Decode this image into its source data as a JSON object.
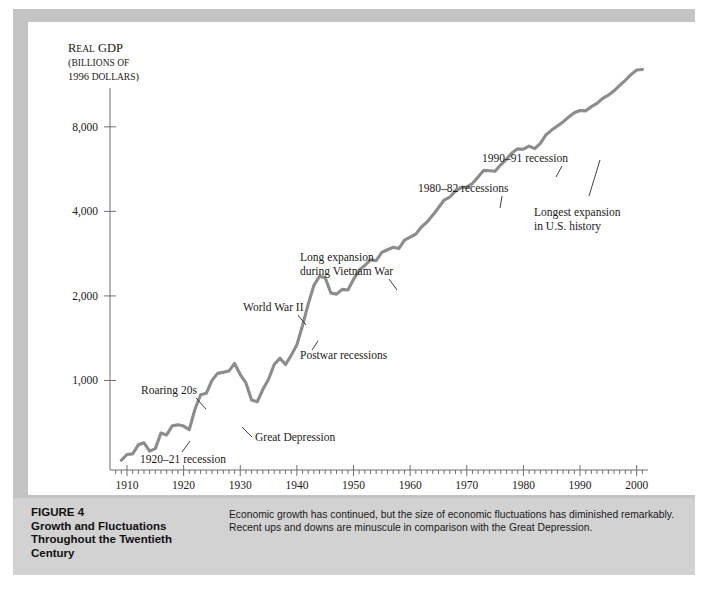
{
  "figure": {
    "caption_label": "FIGURE 4",
    "caption_title_lines": [
      "Growth and Fluctuations",
      "Throughout the Twentieth",
      "Century"
    ],
    "caption_body_lines": [
      "Economic growth has continued, but the size of economic fluctuations has diminished remarkably.",
      "Recent ups and downs are minuscule in comparison with the Great Depression."
    ],
    "frame_color": "#c4c4c4",
    "caption_band_color": "#d2d2d2"
  },
  "chart_data": {
    "type": "line",
    "title": "",
    "xlabel": "",
    "ylabel": "Real GDP (billions of 1996 dollars)",
    "ylabel_lines": [
      "Real GDP",
      "(billions of",
      "1996 dollars)"
    ],
    "yscale": "log",
    "ylim": [
      480,
      11000
    ],
    "xlim": [
      1907,
      2002
    ],
    "grid": false,
    "legend": "none",
    "line_color": "#8c8c8c",
    "yticks": [
      1000,
      2000,
      4000,
      8000
    ],
    "ytick_labels": [
      "1,000",
      "2,000",
      "4,000",
      "8,000"
    ],
    "xticks": [
      1910,
      1920,
      1930,
      1940,
      1950,
      1960,
      1970,
      1980,
      1990,
      2000
    ],
    "xtick_labels": [
      "1910",
      "1920",
      "1930",
      "1940",
      "1950",
      "1960",
      "1970",
      "1980",
      "1990",
      "2000"
    ],
    "x_minor_tick_step": 1,
    "series": [
      {
        "name": "Real GDP",
        "x": [
          1909,
          1910,
          1911,
          1912,
          1913,
          1914,
          1915,
          1916,
          1917,
          1918,
          1919,
          1920,
          1921,
          1922,
          1923,
          1924,
          1925,
          1926,
          1927,
          1928,
          1929,
          1930,
          1931,
          1932,
          1933,
          1934,
          1935,
          1936,
          1937,
          1938,
          1939,
          1940,
          1941,
          1942,
          1943,
          1944,
          1945,
          1946,
          1947,
          1948,
          1949,
          1950,
          1951,
          1952,
          1953,
          1954,
          1955,
          1956,
          1957,
          1958,
          1959,
          1960,
          1961,
          1962,
          1963,
          1964,
          1965,
          1966,
          1967,
          1968,
          1969,
          1970,
          1971,
          1972,
          1973,
          1974,
          1975,
          1976,
          1977,
          1978,
          1979,
          1980,
          1981,
          1982,
          1983,
          1984,
          1985,
          1986,
          1987,
          1988,
          1989,
          1990,
          1991,
          1992,
          1993,
          1994,
          1995,
          1996,
          1997,
          1998,
          1999,
          2000,
          2001
        ],
        "values": [
          520,
          545,
          548,
          590,
          600,
          560,
          572,
          650,
          640,
          690,
          695,
          688,
          668,
          790,
          890,
          900,
          1000,
          1060,
          1070,
          1080,
          1150,
          1050,
          980,
          852,
          840,
          930,
          1010,
          1140,
          1200,
          1140,
          1230,
          1340,
          1570,
          1870,
          2180,
          2350,
          2320,
          2050,
          2030,
          2110,
          2100,
          2290,
          2470,
          2570,
          2690,
          2670,
          2860,
          2920,
          2980,
          2950,
          3160,
          3240,
          3320,
          3520,
          3670,
          3880,
          4120,
          4390,
          4500,
          4720,
          4870,
          4880,
          5030,
          5300,
          5600,
          5580,
          5560,
          5860,
          6130,
          6470,
          6680,
          6660,
          6830,
          6690,
          6990,
          7500,
          7790,
          8060,
          8330,
          8670,
          8980,
          9150,
          9120,
          9440,
          9700,
          10100,
          10370,
          10750,
          11230,
          11720,
          12270,
          12750,
          12810
        ]
      }
    ],
    "annotations": [
      {
        "id": "recession-1920-21",
        "text": "1920–21 recession",
        "year": 1921,
        "value": 668
      },
      {
        "id": "roaring-20s",
        "text": "Roaring 20s",
        "year": 1926,
        "value": 1060
      },
      {
        "id": "great-depression",
        "text": "Great Depression",
        "year": 1933,
        "value": 840
      },
      {
        "id": "world-war-ii",
        "text": "World War II",
        "year": 1944,
        "value": 2350
      },
      {
        "id": "postwar-recessions",
        "text": "Postwar recessions",
        "year": 1946,
        "value": 2050
      },
      {
        "id": "vietnam-expansion",
        "text": "Long expansion during Vietnam War",
        "text_lines": [
          "Long expansion",
          "during Vietnam War"
        ],
        "year": 1966,
        "value": 4390
      },
      {
        "id": "recessions-1980-82",
        "text": "1980–82 recessions",
        "year": 1981,
        "value": 6830
      },
      {
        "id": "recession-1990-91",
        "text": "1990–91 recession",
        "year": 1991,
        "value": 9120
      },
      {
        "id": "longest-expansion",
        "text": "Longest expansion in U.S. history",
        "text_lines": [
          "Longest expansion",
          "in U.S. history"
        ],
        "year": 1997,
        "value": 11230
      }
    ]
  }
}
